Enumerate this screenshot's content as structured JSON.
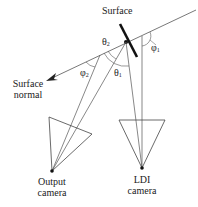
{
  "labels": {
    "surface": "Surface",
    "surface_normal_line1": "Surface",
    "surface_normal_line2": "normal",
    "output_camera_line1": "Output",
    "output_camera_line2": "camera",
    "ldi_camera_line1": "LDI",
    "ldi_camera_line2": "camera"
  },
  "angles": {
    "theta2": "θ",
    "theta2_sub": "2",
    "theta1": "θ",
    "theta1_sub": "1",
    "phi1": "φ",
    "phi1_sub": "1",
    "phi2": "φ",
    "phi2_sub": "2"
  },
  "colors": {
    "line": "#555555",
    "surface": "#111111"
  }
}
